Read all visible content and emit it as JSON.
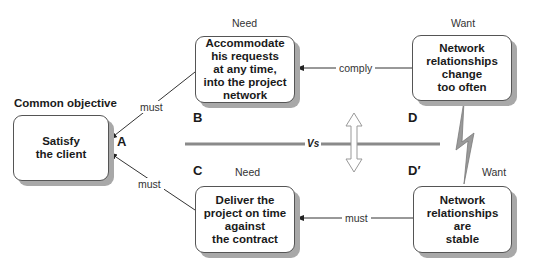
{
  "diagram": {
    "common_objective_heading": "Common objective",
    "nodes": {
      "A": {
        "letter": "A",
        "text": "Satisfy\nthe client"
      },
      "B": {
        "letter": "B",
        "category": "Need",
        "text": "Accommodate\nhis requests\nat any time,\ninto the project\nnetwork"
      },
      "C": {
        "letter": "C",
        "category": "Need",
        "text": "Deliver the\nproject on time\nagainst\nthe contract"
      },
      "D": {
        "letter": "D",
        "category": "Want",
        "text": "Network\nrelationships\nchange\ntoo often"
      },
      "D_prime": {
        "letter": "D′",
        "category": "Want",
        "text": "Network\nrelationships\nare\nstable"
      }
    },
    "edges": [
      {
        "from": "B",
        "to": "A",
        "label": "must"
      },
      {
        "from": "C",
        "to": "A",
        "label": "must"
      },
      {
        "from": "D",
        "to": "B",
        "label": "comply"
      },
      {
        "from": "D_prime",
        "to": "C",
        "label": "must"
      }
    ],
    "conflict_label": "Vs",
    "colors": {
      "box_border": "#555555",
      "shadow": "#a8a8a8",
      "divider": "#8a8a8a",
      "arrow": "#222222"
    }
  }
}
